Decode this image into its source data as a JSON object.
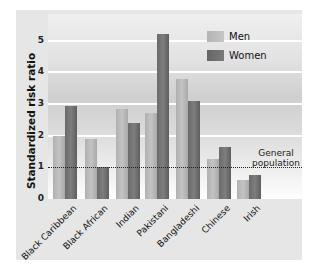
{
  "chart_data": {
    "type": "bar",
    "title": "",
    "xlabel": "",
    "ylabel": "Standardized risk ratio",
    "ylim": [
      0,
      5.5
    ],
    "yticks": [
      "0",
      "1",
      "2",
      "3",
      "4",
      "5"
    ],
    "grid": true,
    "legend_position": "top-right",
    "categories": [
      "Black Caribbean",
      "Black African",
      "Indian",
      "Pakistani",
      "Bangladeshi",
      "Chinese",
      "Irish"
    ],
    "series": [
      {
        "name": "Men",
        "color": "#b8b8b8",
        "values": [
          2.0,
          1.9,
          2.85,
          2.7,
          3.8,
          1.25,
          0.6
        ]
      },
      {
        "name": "Women",
        "color": "#707070",
        "values": [
          2.95,
          1.0,
          2.4,
          5.2,
          3.1,
          1.65,
          0.75
        ]
      }
    ],
    "reference_line": {
      "value": 1,
      "label_line1": "General",
      "label_line2": "population",
      "style": "dotted"
    }
  }
}
